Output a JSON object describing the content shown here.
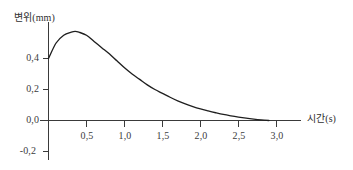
{
  "chart_data": {
    "type": "line",
    "title": "",
    "xlabel": "시간(s)",
    "ylabel": "변위(mm)",
    "xlim": [
      0.0,
      3.3
    ],
    "ylim": [
      -0.2,
      0.65
    ],
    "grid": false,
    "legend": null,
    "x_ticks": [
      "0,5",
      "1,0",
      "1,5",
      "2,0",
      "2,5",
      "3,0"
    ],
    "x_tick_values": [
      0.5,
      1.0,
      1.5,
      2.0,
      2.5,
      3.0
    ],
    "y_ticks": [
      "0,4",
      "0,2",
      "0,0",
      "-0,2"
    ],
    "y_tick_values": [
      0.4,
      0.2,
      0.0,
      -0.2
    ],
    "series": [
      {
        "name": "변위",
        "x": [
          0.0,
          0.1,
          0.2,
          0.3,
          0.35,
          0.4,
          0.5,
          0.6,
          0.7,
          0.8,
          0.9,
          1.0,
          1.1,
          1.2,
          1.3,
          1.4,
          1.5,
          1.6,
          1.7,
          1.8,
          1.9,
          2.0,
          2.1,
          2.2,
          2.3,
          2.4,
          2.5,
          2.6,
          2.7,
          2.8,
          2.9
        ],
        "values": [
          0.4,
          0.5,
          0.55,
          0.57,
          0.575,
          0.57,
          0.55,
          0.51,
          0.47,
          0.43,
          0.385,
          0.34,
          0.3,
          0.265,
          0.23,
          0.2,
          0.175,
          0.15,
          0.127,
          0.107,
          0.09,
          0.075,
          0.062,
          0.05,
          0.039,
          0.03,
          0.022,
          0.015,
          0.009,
          0.004,
          0.0
        ]
      }
    ],
    "annotations": [],
    "curve_color": "#1f1f1f",
    "axis_color": "#3a3a3a"
  }
}
